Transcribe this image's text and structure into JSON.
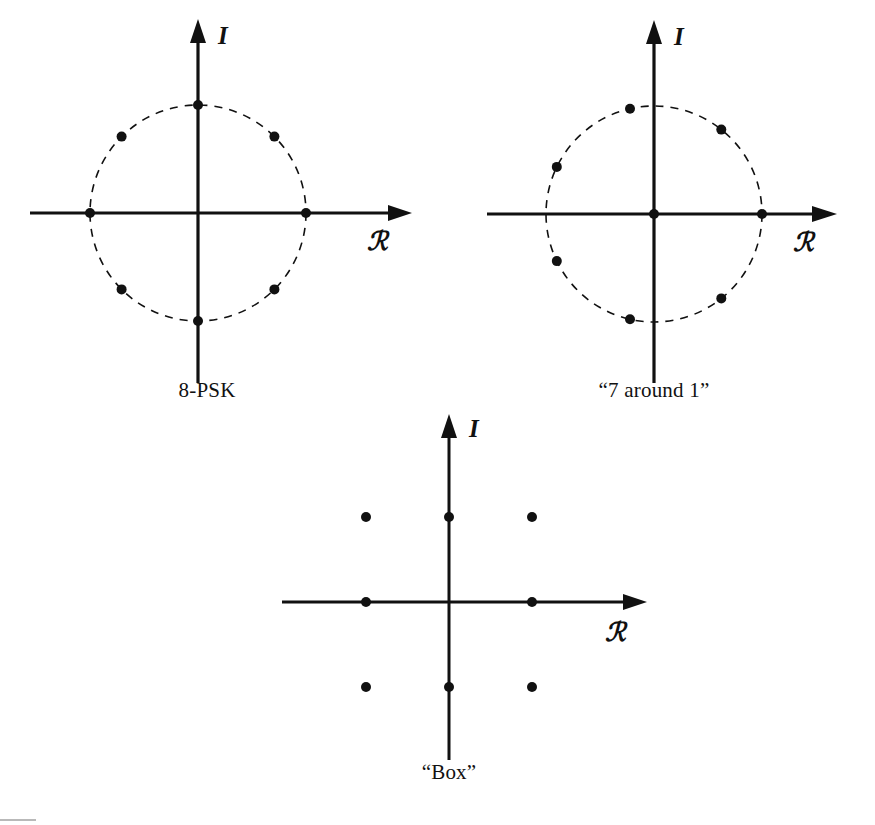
{
  "figure": {
    "background_color": "#ffffff",
    "ink_color": "#111111",
    "width": 875,
    "height": 825
  },
  "axis_labels": {
    "imaginary": "I",
    "real": "ℛ"
  },
  "panels": [
    {
      "id": "8-psk",
      "caption": "8-PSK",
      "caption_x": 207,
      "caption_y": 379,
      "center": {
        "x": 198,
        "y": 213
      },
      "radius": 108,
      "circle_style": "dashed",
      "has_circle": true,
      "origin_point": false,
      "point_count": 8,
      "points_polar_deg": [
        0,
        45,
        90,
        135,
        180,
        225,
        270,
        315
      ],
      "axis": {
        "x_left": 30,
        "x_right": 395,
        "y_top": 20,
        "y_bottom": 383,
        "i_label_x": 218,
        "i_label_y": 44,
        "r_label_x": 367,
        "r_label_y": 250
      }
    },
    {
      "id": "7-around-1",
      "caption": "“7 around 1”",
      "caption_x": 654,
      "caption_y": 379,
      "center": {
        "x": 654,
        "y": 214
      },
      "radius": 108,
      "circle_style": "dashed",
      "has_circle": true,
      "origin_point": true,
      "point_count": 8,
      "points_polar_deg": [
        0,
        51.4,
        102.9,
        154.3,
        205.7,
        257.1,
        308.6
      ],
      "axis": {
        "x_left": 487,
        "x_right": 851,
        "y_top": 21,
        "y_bottom": 383,
        "i_label_x": 674,
        "i_label_y": 45,
        "r_label_x": 823,
        "r_label_y": 251
      }
    },
    {
      "id": "box",
      "caption": "“Box”",
      "caption_x": 443,
      "caption_y": 765,
      "center": {
        "x": 449,
        "y": 601
      },
      "radius": 0,
      "circle_style": "none",
      "has_circle": false,
      "origin_point": false,
      "point_count": 8,
      "grid_spacing": 83,
      "points_cartesian": [
        {
          "x": -1,
          "y": 1
        },
        {
          "x": 0,
          "y": 1
        },
        {
          "x": 1,
          "y": 1
        },
        {
          "x": -1,
          "y": 0
        },
        {
          "x": 1,
          "y": 0
        },
        {
          "x": -1,
          "y": -1
        },
        {
          "x": 0,
          "y": -1
        },
        {
          "x": 1,
          "y": -1
        }
      ],
      "axis": {
        "x_left": 282,
        "x_right": 650,
        "y_top": 410,
        "y_bottom": 760,
        "i_label_x": 469,
        "i_label_y": 435,
        "r_label_x": 621,
        "r_label_y": 640
      }
    }
  ],
  "point_radius": 5
}
